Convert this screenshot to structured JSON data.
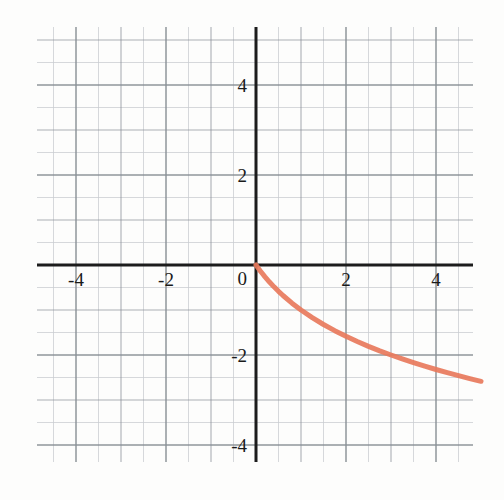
{
  "chart_data": {
    "type": "line",
    "title": "",
    "subtitle": "",
    "xlabel": "",
    "ylabel": "",
    "xlim": [
      -5,
      5
    ],
    "ylim": [
      -5,
      5
    ],
    "grid": true,
    "grid_minor_step": 0.5,
    "grid_major_step": 1,
    "legend": false,
    "legend_position": "none",
    "background_style": "graph-paper",
    "xticks": [
      -4,
      -2,
      0,
      2,
      4
    ],
    "xtick_labels": [
      "-4",
      "-2",
      "0",
      "2",
      "4"
    ],
    "yticks": [
      4,
      2,
      -2,
      -4
    ],
    "ytick_labels": [
      "4",
      "2",
      "-2",
      "-4"
    ],
    "origin_label": "0",
    "axis_color": "#1c1c1c",
    "grid_minor_color": "#c9ccd1",
    "grid_major_color": "#8a9097",
    "curve_color": "#e8795c",
    "curve_width": 5,
    "series": [
      {
        "name": "curve",
        "equation": "y = -log2(x + 1)",
        "domain": [
          0,
          5
        ],
        "color": "#e8795c",
        "x": [
          0,
          0.05,
          0.1,
          0.15,
          0.2,
          0.3,
          0.4,
          0.5,
          0.6,
          0.8,
          1.0,
          1.25,
          1.5,
          1.75,
          2.0,
          2.25,
          2.5,
          2.75,
          3.0,
          3.25,
          3.5,
          3.75,
          4.0,
          4.25,
          4.5,
          4.75,
          5.0
        ],
        "y": [
          0,
          -0.0704,
          -0.1375,
          -0.2016,
          -0.263,
          -0.3785,
          -0.4854,
          -0.585,
          -0.6781,
          -0.848,
          -1.0,
          -1.1699,
          -1.3219,
          -1.4594,
          -1.585,
          -1.7004,
          -1.8074,
          -1.9069,
          -2.0,
          -2.0875,
          -2.1699,
          -2.2479,
          -2.3219,
          -2.3923,
          -2.4594,
          -2.5236,
          -2.585
        ]
      }
    ],
    "annotations": []
  },
  "axes_geometry": {
    "note": "pixel anchors read from the screenshot",
    "origin_px": {
      "x": 256,
      "y": 265
    },
    "unit_px": 45,
    "grid_bounds_px": {
      "left": 37,
      "top": 27,
      "right": 473,
      "bottom": 462
    }
  }
}
